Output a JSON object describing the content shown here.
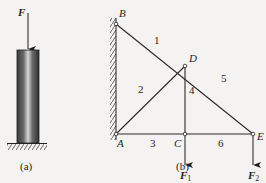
{
  "figure_a": {
    "load_label": "F",
    "caption": "(a)"
  },
  "figure_b": {
    "nodes": {
      "B": "B",
      "D": "D",
      "A": "A",
      "C": "C",
      "E": "E"
    },
    "members": {
      "m1": "1",
      "m2": "2",
      "m3": "3",
      "m4": "4",
      "m5": "5",
      "m6": "6"
    },
    "loads": {
      "F1": "F",
      "F1_sub": "1",
      "F2": "F",
      "F2_sub": "2"
    },
    "caption": "(b)"
  },
  "colors": {
    "line": "#2a2a2a",
    "background": "#f4f3f1"
  }
}
